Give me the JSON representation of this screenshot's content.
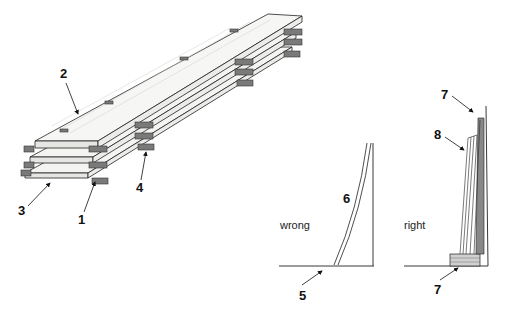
{
  "figure": {
    "top_fragment": "",
    "stack": {
      "callouts": [
        {
          "id": "1",
          "label": "1"
        },
        {
          "id": "2",
          "label": "2"
        },
        {
          "id": "3",
          "label": "3"
        },
        {
          "id": "4",
          "label": "4"
        }
      ]
    },
    "wrong": {
      "caption": "wrong",
      "callouts": [
        {
          "id": "5",
          "label": "5"
        },
        {
          "id": "6",
          "label": "6"
        }
      ]
    },
    "right": {
      "caption": "right",
      "callouts": [
        {
          "id": "7-top",
          "label": "7"
        },
        {
          "id": "8",
          "label": "8"
        },
        {
          "id": "7-bottom",
          "label": "7"
        }
      ]
    },
    "colors": {
      "line": "#222222",
      "sticker": "#7a7a7a",
      "sticker_dark": "#4a4a4a",
      "board_face": "#f4f4f2",
      "board_edge": "#e6e6e3"
    }
  }
}
